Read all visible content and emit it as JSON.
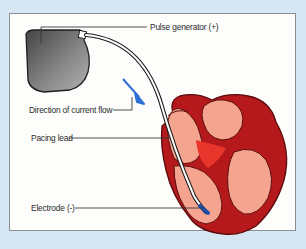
{
  "diagram": {
    "labels": {
      "pulse_generator": "Pulse generator (+)",
      "current_flow": "Direction of current flow",
      "pacing_lead": "Pacing lead",
      "electrode": "Electrode (-)"
    },
    "colors": {
      "background": "#d6e6f3",
      "panel": "#fdfdfb",
      "heart_wall": "#b5191c",
      "heart_chamber": "#f4a48f",
      "heart_septum": "#e8362c",
      "generator_dark": "#4a4a4a",
      "generator_light": "#a5a5a5",
      "arrow": "#2d6fd6",
      "electrode_tip": "#1e4fa8"
    }
  }
}
